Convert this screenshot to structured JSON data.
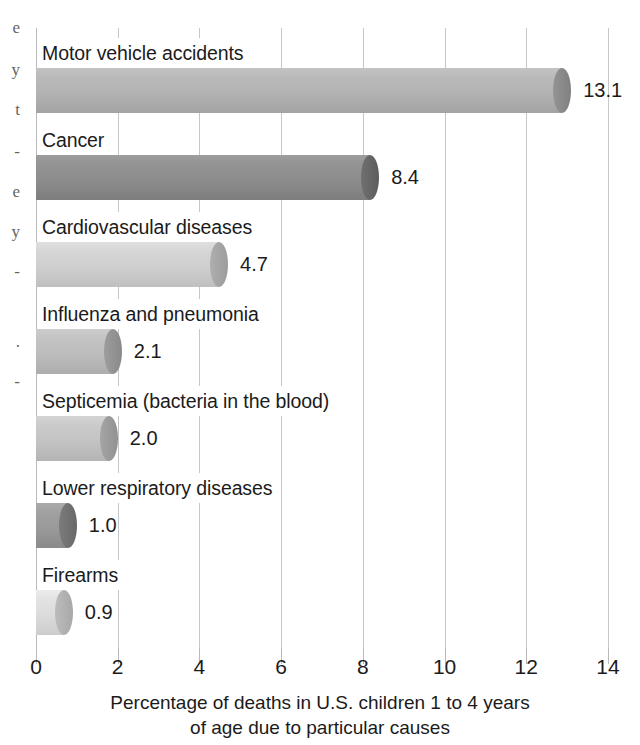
{
  "chart_data": {
    "type": "bar",
    "orientation": "horizontal",
    "title": "",
    "xlabel_line1": "Percentage of deaths in U.S. children 1 to 4 years",
    "xlabel_line2": "of age due to particular causes",
    "ylabel": "",
    "xlim": [
      0,
      14
    ],
    "grid": true,
    "legend": "none",
    "xticks": [
      "0",
      "2",
      "4",
      "6",
      "8",
      "10",
      "12",
      "14"
    ],
    "xtick_values": [
      0,
      2,
      4,
      6,
      8,
      10,
      12,
      14
    ],
    "categories": [
      "Motor vehicle accidents",
      "Cancer",
      "Cardiovascular diseases",
      "Influenza and pneumonia",
      "Septicemia (bacteria in the blood)",
      "Lower respiratory diseases",
      "Firearms"
    ],
    "values": [
      13.1,
      8.4,
      4.7,
      2.1,
      2.0,
      1.0,
      0.9
    ],
    "value_labels": [
      "13.1",
      "8.4",
      "4.7",
      "2.1",
      "2.0",
      "1.0",
      "0.9"
    ],
    "bar_colors": [
      "#b3b3b3",
      "#8d8d8d",
      "#cfcfcf",
      "#bdbdbd",
      "#c4c4c4",
      "#9a9a9a",
      "#dcdcdc"
    ],
    "bar_cap_colors": [
      "#9a9a9a",
      "#767676",
      "#b5b5b5",
      "#a3a3a3",
      "#ababab",
      "#828282",
      "#c2c2c2"
    ]
  },
  "edge_fragments": {
    "colors": {
      "text": "#4a4a4a"
    },
    "items": [
      {
        "text": "e",
        "top": 18
      },
      {
        "text": "y",
        "top": 60
      },
      {
        "text": "t",
        "top": 100
      },
      {
        "text": "-",
        "top": 142
      },
      {
        "text": "e",
        "top": 182
      },
      {
        "text": "y",
        "top": 222
      },
      {
        "text": "-",
        "top": 262
      },
      {
        "text": ".",
        "top": 332
      },
      {
        "text": "-",
        "top": 372
      }
    ]
  },
  "colors": {
    "gridline": "#c6c6c6",
    "axis": "#b9b9b9",
    "text": "#1b1b1b",
    "background": "#ffffff"
  }
}
